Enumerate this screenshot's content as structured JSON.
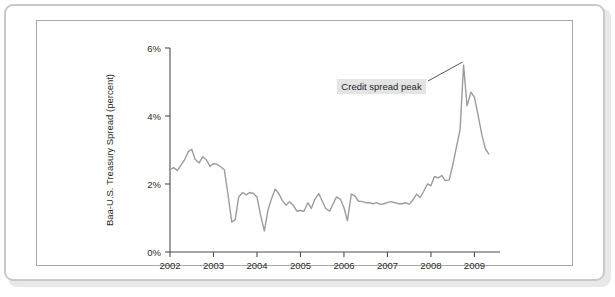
{
  "figure": {
    "frame_color": "#c9c9c9",
    "inner_frame_color": "#a8a8a8",
    "background": "#ffffff"
  },
  "chart_data": {
    "type": "line",
    "title": "",
    "subtitle": "",
    "xlabel": "",
    "ylabel": "Baa-U.S. Treasury Spread (percent)",
    "xlim": [
      2002.0,
      2009.45
    ],
    "ylim": [
      0,
      6
    ],
    "grid": false,
    "legend": null,
    "line_color": "#9c9c9c",
    "x_tick_labels": [
      "2002",
      "2003",
      "2004",
      "2005",
      "2006",
      "2007",
      "2008",
      "2009"
    ],
    "x_tick_values": [
      2002,
      2003,
      2004,
      2005,
      2006,
      2007,
      2008,
      2009
    ],
    "y_tick_labels": [
      "0%",
      "2%",
      "4%",
      "6%"
    ],
    "y_tick_values": [
      0,
      2,
      4,
      6
    ],
    "annotations": [
      {
        "text": "Credit spread peak",
        "points_to_x": 2008.75,
        "points_to_y": 5.5,
        "box_background": "#e4e4e4"
      }
    ],
    "series": [
      {
        "name": "Baa-U.S. Treasury Spread",
        "x": [
          2002.0,
          2002.08,
          2002.17,
          2002.25,
          2002.33,
          2002.42,
          2002.5,
          2002.58,
          2002.67,
          2002.75,
          2002.83,
          2002.92,
          2003.0,
          2003.08,
          2003.17,
          2003.25,
          2003.33,
          2003.42,
          2003.5,
          2003.58,
          2003.67,
          2003.75,
          2003.83,
          2003.92,
          2004.0,
          2004.08,
          2004.17,
          2004.25,
          2004.33,
          2004.42,
          2004.5,
          2004.58,
          2004.67,
          2004.75,
          2004.83,
          2004.92,
          2005.0,
          2005.08,
          2005.17,
          2005.25,
          2005.33,
          2005.42,
          2005.5,
          2005.58,
          2005.67,
          2005.75,
          2005.83,
          2005.92,
          2006.0,
          2006.08,
          2006.17,
          2006.25,
          2006.33,
          2006.42,
          2006.5,
          2006.58,
          2006.67,
          2006.75,
          2006.83,
          2006.92,
          2007.0,
          2007.08,
          2007.17,
          2007.25,
          2007.33,
          2007.42,
          2007.5,
          2007.58,
          2007.67,
          2007.75,
          2007.83,
          2007.92,
          2008.0,
          2008.08,
          2008.17,
          2008.25,
          2008.33,
          2008.42,
          2008.5,
          2008.58,
          2008.67,
          2008.75,
          2008.83,
          2008.92,
          2009.0,
          2009.08,
          2009.17,
          2009.25,
          2009.33
        ],
        "y": [
          2.42,
          2.48,
          2.4,
          2.55,
          2.7,
          2.95,
          3.02,
          2.72,
          2.62,
          2.8,
          2.72,
          2.52,
          2.6,
          2.58,
          2.5,
          2.42,
          1.72,
          0.88,
          0.95,
          1.62,
          1.75,
          1.68,
          1.75,
          1.72,
          1.62,
          1.1,
          0.62,
          1.22,
          1.55,
          1.85,
          1.72,
          1.52,
          1.38,
          1.48,
          1.38,
          1.2,
          1.22,
          1.2,
          1.45,
          1.28,
          1.55,
          1.72,
          1.5,
          1.28,
          1.2,
          1.42,
          1.62,
          1.55,
          1.3,
          0.92,
          1.7,
          1.65,
          1.5,
          1.48,
          1.45,
          1.45,
          1.42,
          1.45,
          1.4,
          1.42,
          1.45,
          1.48,
          1.45,
          1.42,
          1.42,
          1.45,
          1.4,
          1.52,
          1.7,
          1.6,
          1.78,
          2.0,
          1.95,
          2.22,
          2.18,
          2.25,
          2.1,
          2.12,
          2.55,
          3.05,
          3.6,
          5.5,
          4.3,
          4.7,
          4.55,
          4.05,
          3.45,
          3.05,
          2.88
        ]
      }
    ]
  }
}
